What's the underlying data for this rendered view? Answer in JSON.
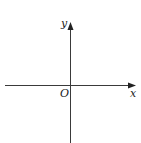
{
  "diagram": {
    "type": "coordinate-axes",
    "labels": {
      "x_axis": "x",
      "y_axis": "y",
      "origin": "O"
    },
    "colors": {
      "axis": "#3a3a3a",
      "background": "#ffffff"
    }
  }
}
